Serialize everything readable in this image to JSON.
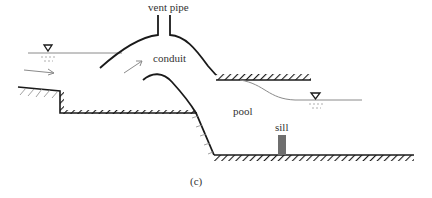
{
  "figure": {
    "caption": "(c)",
    "labels": {
      "vent_pipe": "vent pipe",
      "conduit": "conduit",
      "pool": "pool",
      "sill": "sill"
    }
  },
  "colors": {
    "line": "#1a1a1a",
    "water": "#8a8a8a",
    "sill": "#6e6e6e",
    "text": "#333333"
  }
}
